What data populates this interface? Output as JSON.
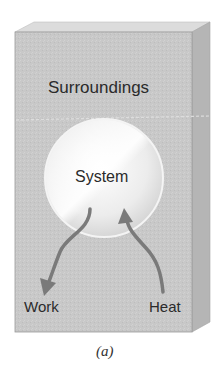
{
  "diagram": {
    "type": "thermodynamic-system-diagram",
    "labels": {
      "surroundings": "Surroundings",
      "system": "System",
      "work": "Work",
      "heat": "Heat"
    },
    "caption": "(a)",
    "arrows": [
      {
        "label": "Work",
        "direction": "out-of-system"
      },
      {
        "label": "Heat",
        "direction": "into-system"
      }
    ],
    "colors": {
      "box_front": "#c9c9c9",
      "box_top": "#dedede",
      "box_side": "#b3b3b3",
      "system_circle": "#eeeeee",
      "arrow": "#7a7a7a",
      "text": "#2b2b2b"
    }
  }
}
